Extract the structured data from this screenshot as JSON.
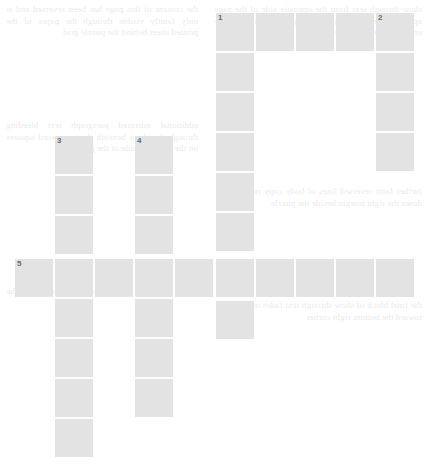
{
  "puzzle": {
    "title": "",
    "grid": {
      "cell_size": 38,
      "pitch_x": 40,
      "pitch_y": 40,
      "origin_x": 15,
      "origin_y": 13,
      "cell_color": "#e3e3e3",
      "background_color": "#ffffff",
      "number_color": "#6a6a6a",
      "columns": 11,
      "rows": 12
    },
    "numbers": [
      "1",
      "2",
      "3",
      "4",
      "5"
    ],
    "entries": [
      {
        "number": "1",
        "direction": "across",
        "length": 5,
        "row": 0,
        "col": 5
      },
      {
        "number": "1",
        "direction": "down",
        "length": 9,
        "row": 0,
        "col": 5
      },
      {
        "number": "2",
        "direction": "down",
        "length": 5,
        "row": 0,
        "col": 9
      },
      {
        "number": "3",
        "direction": "down",
        "length": 9,
        "row": 3,
        "col": 1
      },
      {
        "number": "4",
        "direction": "down",
        "length": 8,
        "row": 3,
        "col": 3
      },
      {
        "number": "5",
        "direction": "across",
        "length": 10,
        "row": 6,
        "col": 0
      }
    ],
    "cells": [
      {
        "num": "1",
        "x": 216,
        "y": 13
      },
      {
        "num": "",
        "x": 256,
        "y": 13
      },
      {
        "num": "",
        "x": 296,
        "y": 13
      },
      {
        "num": "",
        "x": 336,
        "y": 13
      },
      {
        "num": "2",
        "x": 376,
        "y": 13
      },
      {
        "num": "",
        "x": 216,
        "y": 53
      },
      {
        "num": "",
        "x": 376,
        "y": 53
      },
      {
        "num": "",
        "x": 216,
        "y": 93
      },
      {
        "num": "",
        "x": 376,
        "y": 93
      },
      {
        "num": "3",
        "x": 55,
        "y": 136
      },
      {
        "num": "4",
        "x": 135,
        "y": 136
      },
      {
        "num": "",
        "x": 216,
        "y": 133
      },
      {
        "num": "",
        "x": 376,
        "y": 133
      },
      {
        "num": "",
        "x": 55,
        "y": 176
      },
      {
        "num": "",
        "x": 135,
        "y": 176
      },
      {
        "num": "",
        "x": 216,
        "y": 173
      },
      {
        "num": "",
        "x": 55,
        "y": 216
      },
      {
        "num": "",
        "x": 135,
        "y": 216
      },
      {
        "num": "",
        "x": 216,
        "y": 213
      },
      {
        "num": "5",
        "x": 15,
        "y": 259
      },
      {
        "num": "",
        "x": 55,
        "y": 259
      },
      {
        "num": "",
        "x": 95,
        "y": 259
      },
      {
        "num": "",
        "x": 135,
        "y": 259
      },
      {
        "num": "",
        "x": 175,
        "y": 259
      },
      {
        "num": "",
        "x": 216,
        "y": 259
      },
      {
        "num": "",
        "x": 256,
        "y": 259
      },
      {
        "num": "",
        "x": 296,
        "y": 259
      },
      {
        "num": "",
        "x": 336,
        "y": 259
      },
      {
        "num": "",
        "x": 376,
        "y": 259
      },
      {
        "num": "",
        "x": 55,
        "y": 299
      },
      {
        "num": "",
        "x": 135,
        "y": 299
      },
      {
        "num": "",
        "x": 216,
        "y": 301
      },
      {
        "num": "",
        "x": 55,
        "y": 339
      },
      {
        "num": "",
        "x": 135,
        "y": 339
      },
      {
        "num": "",
        "x": 55,
        "y": 379
      },
      {
        "num": "",
        "x": 135,
        "y": 379
      },
      {
        "num": "",
        "x": 55,
        "y": 419
      }
    ]
  },
  "background_text": {
    "col_a": "the content of this page has been reversed and is only faintly visible through the paper of the printed sheet behind the puzzle grid",
    "col_b": "show-through text from the opposite side of the page appears here in a very pale grey tone that is largely unreadable at this scale",
    "col_c": "additional mirrored paragraph text bleeding through the sheet beneath the crossword squares on the left hand side of the page",
    "col_d": "further faint reversed lines of body copy run down the right margin beside the puzzle",
    "col_e": "a few more ghosted lines sit low on the page",
    "col_f": "the final block of show-through text fades out toward the bottom right corner"
  }
}
